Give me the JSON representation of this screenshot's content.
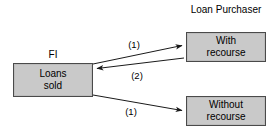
{
  "diagram": {
    "colors": {
      "box_fill": "#c9c9c9",
      "box_border": "#4a4a4a",
      "edge": "#1a1a1a",
      "background": "#ffffff",
      "text": "#000000"
    },
    "captions": {
      "fi": "FI",
      "loan_purchaser_line1": "Loan",
      "loan_purchaser_line2": "Purchaser"
    },
    "nodes": [
      {
        "id": "loans-sold",
        "line1": "Loans",
        "line2": "sold",
        "x": 13,
        "y": 63,
        "width": 80,
        "height": 34
      },
      {
        "id": "with-recourse",
        "line1": "With",
        "line2": "recourse",
        "x": 186,
        "y": 32,
        "width": 80,
        "height": 30
      },
      {
        "id": "without-recourse",
        "line1": "Without",
        "line2": "recourse",
        "x": 186,
        "y": 96,
        "width": 80,
        "height": 30
      }
    ],
    "edges": [
      {
        "id": "fi-to-with-recourse",
        "label": "(1)",
        "from": "loans-sold",
        "to": "with-recourse",
        "direction": "right",
        "x1": 93,
        "y1": 64,
        "x2": 184,
        "y2": 45
      },
      {
        "id": "with-recourse-to-fi",
        "label": "(2)",
        "from": "with-recourse",
        "to": "loans-sold",
        "direction": "left",
        "x1": 184,
        "y1": 58,
        "x2": 95,
        "y2": 69
      },
      {
        "id": "fi-to-without-recourse",
        "label": "(1)",
        "from": "loans-sold",
        "to": "without-recourse",
        "direction": "right",
        "x1": 93,
        "y1": 95,
        "x2": 184,
        "y2": 111
      }
    ]
  }
}
